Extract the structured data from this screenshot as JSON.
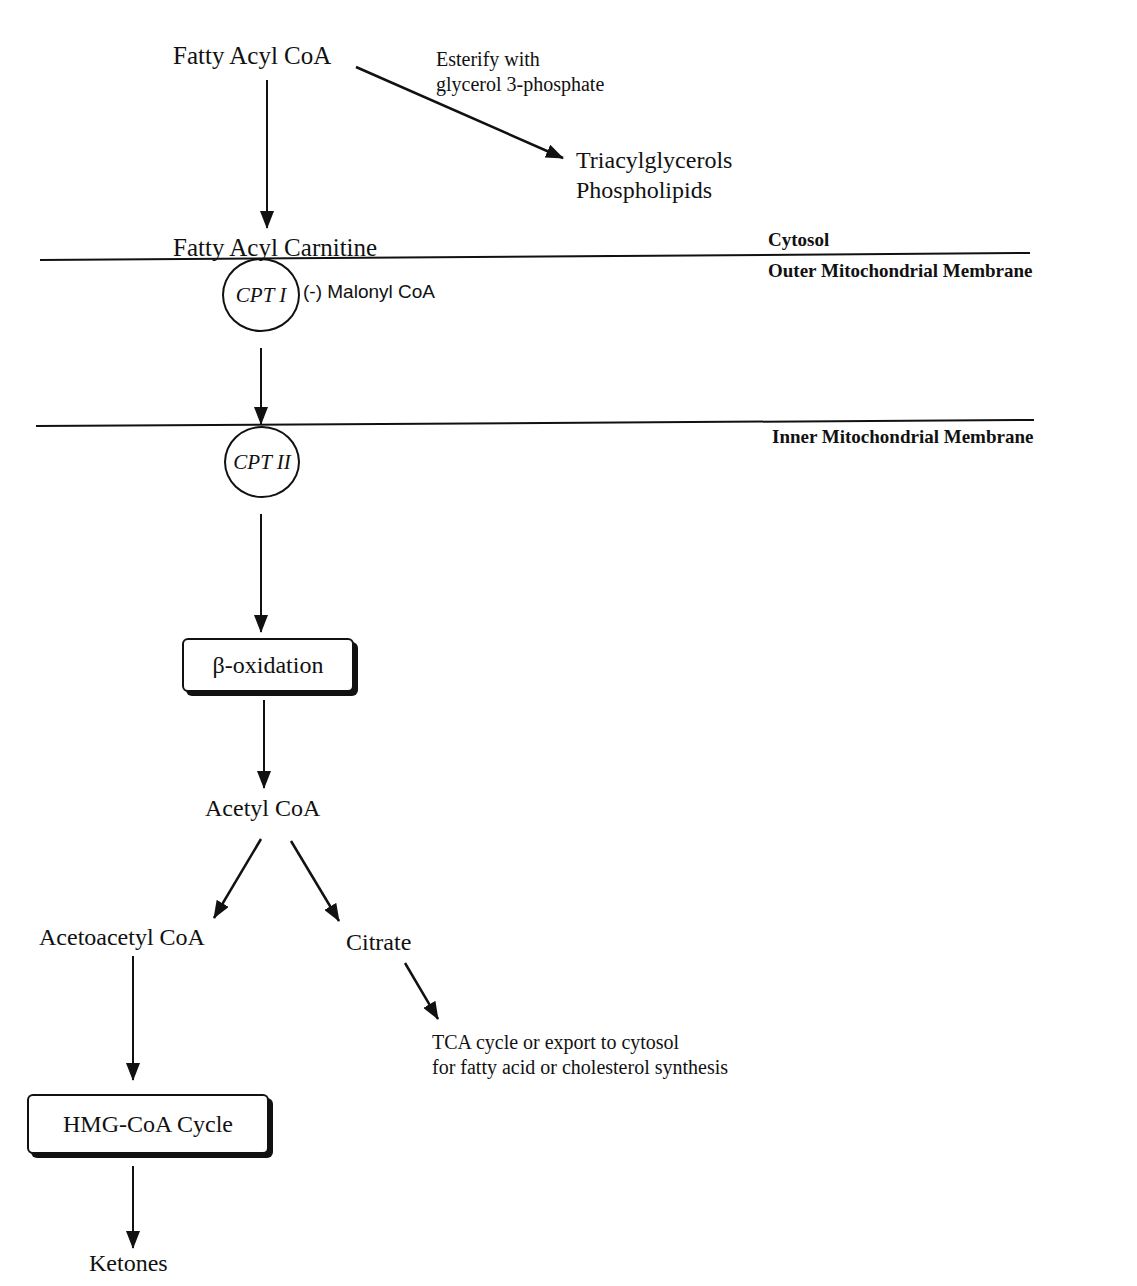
{
  "diagram": {
    "nodes": {
      "fatty_acyl_coa": "Fatty Acyl CoA",
      "esterify_note_line1": "Esterify with",
      "esterify_note_line2": "glycerol 3-phosphate",
      "triacylglycerols": "Triacylglycerols",
      "phospholipids": "Phospholipids",
      "fatty_acyl_carnitine": "Fatty Acyl Carnitine",
      "cpt1": "CPT I",
      "malonyl_inhibitor": "(-) Malonyl CoA",
      "cpt2": "CPT II",
      "beta_oxidation": "β-oxidation",
      "acetyl_coa": "Acetyl CoA",
      "acetoacetyl_coa": "Acetoacetyl CoA",
      "citrate": "Citrate",
      "tca_line1": "TCA cycle or export to cytosol",
      "tca_line2": "for fatty acid or cholesterol synthesis",
      "hmg_coa_cycle": "HMG-CoA Cycle",
      "ketones": "Ketones"
    },
    "compartments": {
      "cytosol": "Cytosol",
      "outer_membrane": "Outer Mitochondrial Membrane",
      "inner_membrane": "Inner Mitochondrial Membrane"
    },
    "colors": {
      "ink": "#111111",
      "background": "#ffffff"
    }
  }
}
